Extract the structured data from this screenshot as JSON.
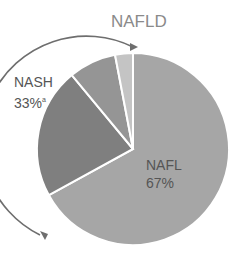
{
  "chart_data": {
    "type": "pie",
    "title": "NAFLD",
    "slices": [
      {
        "label": "NAFL",
        "value": 67,
        "color": "#a6a6a6"
      },
      {
        "label": "NASH (dark)",
        "value": 22,
        "color": "#7f7f7f"
      },
      {
        "label": "NASH (mid)",
        "value": 8,
        "color": "#959595"
      },
      {
        "label": "NASH (light)",
        "value": 3,
        "color": "#c4c4c4"
      }
    ],
    "annotations": [
      {
        "text": "NAFL",
        "sub": "67%"
      },
      {
        "text": "NASH",
        "sub": "33%",
        "superscript": "a"
      }
    ],
    "bracket_arrow": "curved arrow spanning NASH slices (33%)"
  },
  "labels": {
    "title": "NAFLD",
    "nash_name": "NASH",
    "nash_pct": "33%",
    "nash_sup": "a",
    "nafl_name": "NAFL",
    "nafl_pct": "67%"
  }
}
